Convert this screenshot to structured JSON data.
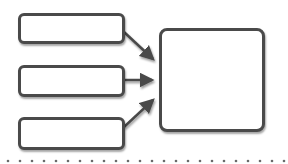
{
  "diagram": {
    "type": "flow",
    "colors": {
      "stroke": "#4a4a4a",
      "fill": "#ffffff",
      "dots": "#6a6a6a"
    },
    "inputs": [
      {
        "id": "input-1",
        "label": ""
      },
      {
        "id": "input-2",
        "label": ""
      },
      {
        "id": "input-3",
        "label": ""
      }
    ],
    "output": {
      "id": "output",
      "label": ""
    },
    "edges": [
      {
        "from": "input-1",
        "to": "output"
      },
      {
        "from": "input-2",
        "to": "output"
      },
      {
        "from": "input-3",
        "to": "output"
      }
    ],
    "separator": "dotted"
  }
}
